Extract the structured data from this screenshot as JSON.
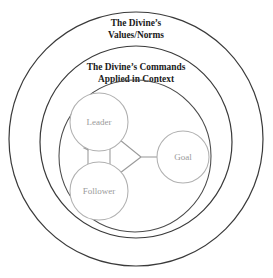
{
  "figure": {
    "kind": "concentric-circle-diagram",
    "background_color": "#ffffff"
  },
  "rings": {
    "outer": {
      "name": "outer-ring",
      "label_line1": "The Divine’s",
      "label_line2": "Values/Norms",
      "stroke_color": "#3a3a3a",
      "cx": 136,
      "cy": 139,
      "r": 127
    },
    "middle": {
      "name": "middle-ring",
      "label_line1": "The Divine’s Commands",
      "label_line2": "Applied in Context",
      "stroke_color": "#3a3a3a",
      "cx": 136,
      "cy": 142,
      "r": 96
    },
    "inner": {
      "name": "inner-ring",
      "label_line1": "",
      "label_line2": "",
      "stroke_color": "#4a4a4a",
      "cx": 135,
      "cy": 156,
      "r": 76
    }
  },
  "nodes": [
    {
      "id": "leader",
      "label": "Leader",
      "cx": 99,
      "cy": 122,
      "r": 29,
      "stroke_color": "#b0b0b0",
      "text_color": "#9a9a9a"
    },
    {
      "id": "follower",
      "label": "Follower",
      "cx": 99,
      "cy": 191,
      "r": 29,
      "stroke_color": "#b0b0b0",
      "text_color": "#9a9a9a"
    },
    {
      "id": "goal",
      "label": "Goal",
      "cx": 183,
      "cy": 157,
      "r": 26,
      "stroke_color": "#b0b0b0",
      "text_color": "#9a9a9a"
    }
  ],
  "connectors": [
    {
      "id": "follower-to-leader",
      "from": "follower",
      "to": "leader",
      "direction": "up",
      "arrowhead": "up",
      "stroke_color": "#9a9a9a"
    },
    {
      "id": "leader-to-follower",
      "from": "leader",
      "to": "follower",
      "direction": "down",
      "arrowhead": "down",
      "stroke_color": "#9a9a9a"
    },
    {
      "id": "leader-to-junction",
      "from": "leader",
      "to": "junction",
      "direction": "none",
      "arrowhead": "none",
      "stroke_color": "#9a9a9a"
    },
    {
      "id": "follower-to-junction",
      "from": "follower",
      "to": "junction",
      "direction": "none",
      "arrowhead": "none",
      "stroke_color": "#9a9a9a"
    },
    {
      "id": "junction-to-goal",
      "from": "junction",
      "to": "goal",
      "direction": "none",
      "arrowhead": "none",
      "stroke_color": "#9a9a9a"
    }
  ]
}
